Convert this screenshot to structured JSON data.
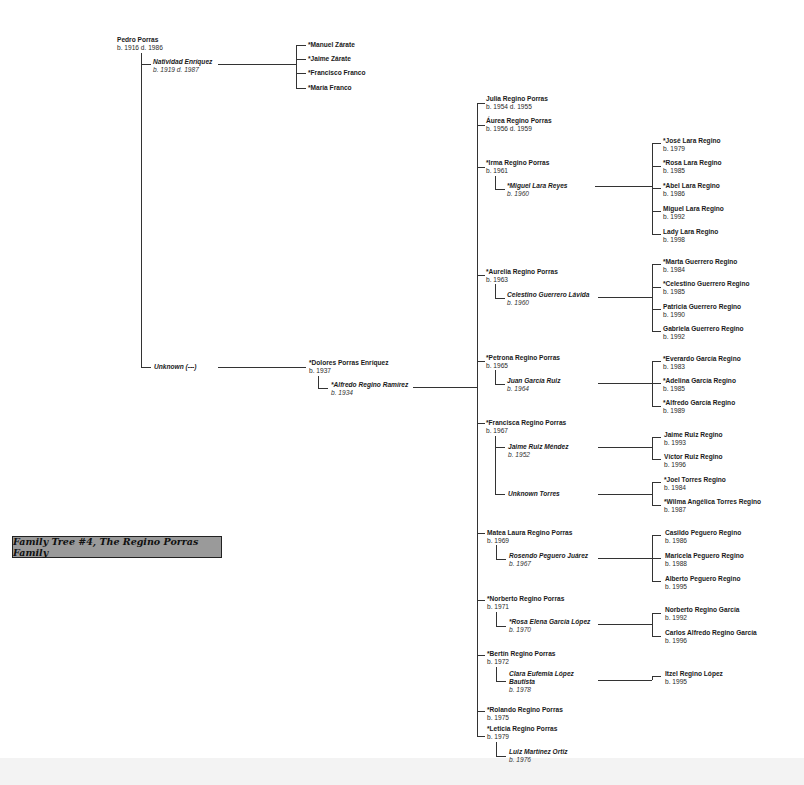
{
  "title": "Family Tree #4, The Regino Porras Family",
  "gen1": {
    "root": {
      "name": "Pedro Porras",
      "dates": "b. 1916 d. 1986"
    },
    "spouse1": {
      "name": "Natividad Enríquez",
      "dates": "b. 1919 d. 1987"
    },
    "spouse1_children": [
      {
        "name": "*Manuel Zárate"
      },
      {
        "name": "*Jaime Zárate"
      },
      {
        "name": "*Francisco Franco"
      },
      {
        "name": "*María Franco"
      }
    ],
    "spouse2": {
      "name": "Unknown (---)"
    }
  },
  "gen2": {
    "child": {
      "name": "*Dolores Porras Enríquez",
      "dates": "b. 1937"
    },
    "spouse": {
      "name": "*Alfredo Regino Ramírez",
      "dates": "b. 1934"
    }
  },
  "gen3": [
    {
      "name": "Julia Regino Porras",
      "dates": "b. 1954 d. 1955"
    },
    {
      "name": "Áurea Regino Porras",
      "dates": "b. 1956 d. 1959"
    },
    {
      "name": "*Irma Regino Porras",
      "dates": "b. 1961",
      "spouse": {
        "name": "*Miguel Lara Reyes",
        "dates": "b. 1960"
      },
      "children": [
        {
          "name": "*José Lara Regino",
          "dates": "b. 1979"
        },
        {
          "name": "*Rosa Lara Regino",
          "dates": "b. 1985"
        },
        {
          "name": "*Abel Lara Regino",
          "dates": "b. 1986"
        },
        {
          "name": "Miguel Lara Regino",
          "dates": "b. 1992"
        },
        {
          "name": "Lady Lara Regino",
          "dates": "b. 1998"
        }
      ]
    },
    {
      "name": "*Aurelia Regino Porras",
      "dates": "b. 1963",
      "spouse": {
        "name": "Celestino Guerrero Lávida",
        "dates": "b. 1960"
      },
      "children": [
        {
          "name": "*Marta Guerrero Regino",
          "dates": "b. 1984"
        },
        {
          "name": "*Celestino Guerrero Regino",
          "dates": "b. 1985"
        },
        {
          "name": "Patricia Guerrero Regino",
          "dates": "b. 1990"
        },
        {
          "name": "Gabriela Guerrero Regino",
          "dates": "b. 1992"
        }
      ]
    },
    {
      "name": "*Petrona Regino Porras",
      "dates": "b. 1965",
      "spouse": {
        "name": "Juan García Ruiz",
        "dates": "b. 1964"
      },
      "children": [
        {
          "name": "*Everardo García Regino",
          "dates": "b. 1983"
        },
        {
          "name": "*Adelina García Regino",
          "dates": "b. 1985"
        },
        {
          "name": "*Alfredo García Regino",
          "dates": "b. 1989"
        }
      ]
    },
    {
      "name": "*Francisca Regino Porras",
      "dates": "b. 1967",
      "spouse": {
        "name": "Jaime Ruiz Méndez",
        "dates": "b. 1952"
      },
      "children": [
        {
          "name": "Jaime Ruiz Regino",
          "dates": "b. 1993"
        },
        {
          "name": "Víctor Ruiz Regino",
          "dates": "b. 1996"
        }
      ],
      "spouse2": {
        "name": "Unknown Torres"
      },
      "children2": [
        {
          "name": "*Joel Torres Regino",
          "dates": "b. 1984"
        },
        {
          "name": "*Wilma Angélica Torres Regino",
          "dates": "b. 1987"
        }
      ]
    },
    {
      "name": "Matea Laura Regino Porras",
      "dates": "b. 1969",
      "spouse": {
        "name": "Rosendo Peguero Juárez",
        "dates": "b. 1967"
      },
      "children": [
        {
          "name": "Casildo Peguero Regino",
          "dates": "b. 1986"
        },
        {
          "name": "Maricela Peguero Regino",
          "dates": "b. 1988"
        },
        {
          "name": "Alberto Peguero Regino",
          "dates": "b. 1995"
        }
      ]
    },
    {
      "name": "*Norberto Regino Porras",
      "dates": "b. 1971",
      "spouse": {
        "name": "*Rosa Elena García López",
        "dates": "b. 1970"
      },
      "children": [
        {
          "name": "Norberto Regino García",
          "dates": "b. 1992"
        },
        {
          "name": "Carlos Alfredo Regino García",
          "dates": "b. 1996"
        }
      ]
    },
    {
      "name": "*Bertín Regino Porras",
      "dates": "b. 1972",
      "spouse": {
        "name1": "Clara Eufemia López",
        "name2": "Bautista",
        "dates": "b. 1978"
      },
      "children": [
        {
          "name": "Itzel Regino López",
          "dates": "b. 1995"
        }
      ]
    },
    {
      "name": "*Rolando Regino Porras",
      "dates": "b. 1975"
    },
    {
      "name": "*Leticia Regino Porras",
      "dates": "b. 1979",
      "spouse": {
        "name": "Luiz Martínez Ortiz",
        "dates": "b. 1976"
      }
    }
  ]
}
